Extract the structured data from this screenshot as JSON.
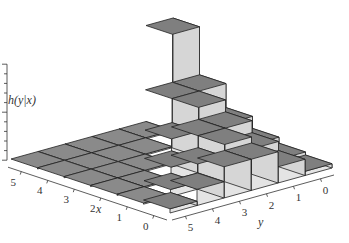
{
  "chart_data": {
    "type": "bar3d",
    "title": "",
    "zlabel": "h(y|x)",
    "xlabel": "x",
    "ylabel": "y",
    "x_ticks": [
      "0",
      "1",
      "2",
      "3",
      "4",
      "5"
    ],
    "y_ticks": [
      "0",
      "1",
      "2",
      "3",
      "4",
      "5"
    ],
    "z_ticks": [
      "0",
      "0.5",
      "1.0"
    ],
    "zlim": [
      0,
      1.0
    ],
    "grid": false,
    "values": [
      {
        "x": 0,
        "y": [
          0.03125,
          0.15625,
          0.3125,
          0.3125,
          0.15625,
          0.03125
        ]
      },
      {
        "x": 1,
        "y": [
          0.0625,
          0.25,
          0.375,
          0.25,
          0.0625,
          0
        ]
      },
      {
        "x": 2,
        "y": [
          0.125,
          0.375,
          0.375,
          0.125,
          0,
          0
        ]
      },
      {
        "x": 3,
        "y": [
          0.25,
          0.5,
          0.25,
          0,
          0,
          0
        ]
      },
      {
        "x": 4,
        "y": [
          0.5,
          0.5,
          0,
          0,
          0,
          0
        ]
      },
      {
        "x": 5,
        "y": [
          1.0,
          0,
          0,
          0,
          0,
          0
        ]
      }
    ],
    "colors": {
      "top": "#7f7f7f",
      "side": "#e4e4e4",
      "side_dark": "#d6d6d6",
      "edge": "#222222",
      "floor": "#8a8a8a"
    }
  }
}
